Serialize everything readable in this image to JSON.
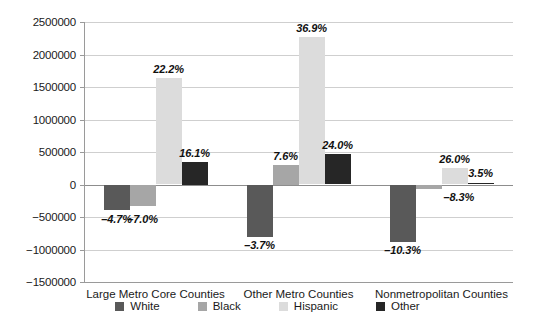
{
  "chart_data": {
    "type": "bar",
    "title": "",
    "subtitle": "",
    "xlabel": "",
    "ylabel": "",
    "ylim": [
      -1500000,
      2500000
    ],
    "ytick_step": 500000,
    "ytick_labels": [
      "2500000",
      "2000000",
      "1500000",
      "1000000",
      "500000",
      "0",
      "−500000",
      "−1000000",
      "−1500000"
    ],
    "ytick_values": [
      2500000,
      2000000,
      1500000,
      1000000,
      500000,
      0,
      -500000,
      -1000000,
      -1500000
    ],
    "grid": true,
    "legend_position": "bottom",
    "categories": [
      "Large Metro Core Counties",
      "Other Metro Counties",
      "Nonmetropolitan Counties"
    ],
    "series": [
      {
        "name": "White",
        "color": "#595959",
        "values": [
          -390000,
          -800000,
          -880000
        ],
        "labels": [
          "–4.7%",
          "–3.7%",
          "–10.3%"
        ]
      },
      {
        "name": "Black",
        "color": "#a6a6a6",
        "values": [
          -330000,
          300000,
          -70000
        ],
        "labels": [
          "–7.0%",
          "7.6%",
          "–8.3%"
        ]
      },
      {
        "name": "Hispanic",
        "color": "#dcdcdc",
        "values": [
          1640000,
          2270000,
          260000
        ],
        "labels": [
          "22.2%",
          "36.9%",
          "26.0%"
        ]
      },
      {
        "name": "Other",
        "color": "#262626",
        "values": [
          350000,
          470000,
          20000
        ],
        "labels": [
          "16.1%",
          "24.0%",
          "3.5%"
        ]
      }
    ]
  },
  "legend": {
    "items": [
      {
        "label": "White",
        "color": "#595959"
      },
      {
        "label": "Black",
        "color": "#a6a6a6"
      },
      {
        "label": "Hispanic",
        "color": "#dcdcdc"
      },
      {
        "label": "Other",
        "color": "#262626"
      }
    ]
  }
}
